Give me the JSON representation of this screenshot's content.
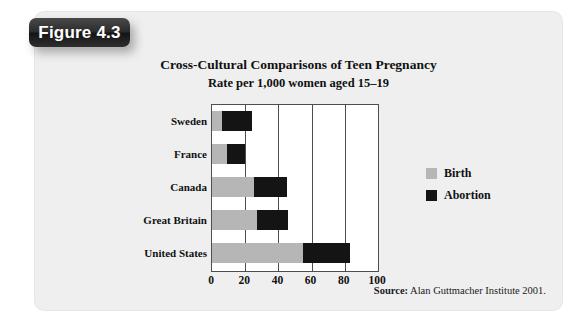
{
  "figure": {
    "badge_label": "Figure 4.3",
    "source_label": "Source:",
    "source_text": "Alan Guttmacher Institute 2001."
  },
  "colors": {
    "panel_background": "#efeff0",
    "badge_background": "#1e1e1e",
    "badge_text": "#ffffff",
    "birth": "#b6b6b6",
    "abortion": "#141414",
    "axis": "#4d4d4d",
    "plot_background": "#ffffff",
    "text": "#111111"
  },
  "chart_data": {
    "type": "bar",
    "orientation": "horizontal",
    "stacked": true,
    "title": "Cross-Cultural Comparisons of Teen Pregnancy",
    "subtitle": "Rate per 1,000 women aged 15–19",
    "xlabel": "",
    "ylabel": "",
    "xlim": [
      0,
      100
    ],
    "xticks": [
      0,
      20,
      40,
      60,
      80,
      100
    ],
    "xtick_labels": [
      "0",
      "20",
      "40",
      "60",
      "80",
      "100"
    ],
    "grid": true,
    "legend_position": "right",
    "categories": [
      "Sweden",
      "France",
      "Canada",
      "Great Britain",
      "United States"
    ],
    "series": [
      {
        "name": "Birth",
        "color": "#b6b6b6",
        "values": [
          6,
          9,
          25,
          27,
          55
        ]
      },
      {
        "name": "Abortion",
        "color": "#141414",
        "values": [
          18,
          11,
          20,
          19,
          28
        ]
      }
    ],
    "totals": [
      24,
      20,
      45,
      46,
      83
    ]
  }
}
